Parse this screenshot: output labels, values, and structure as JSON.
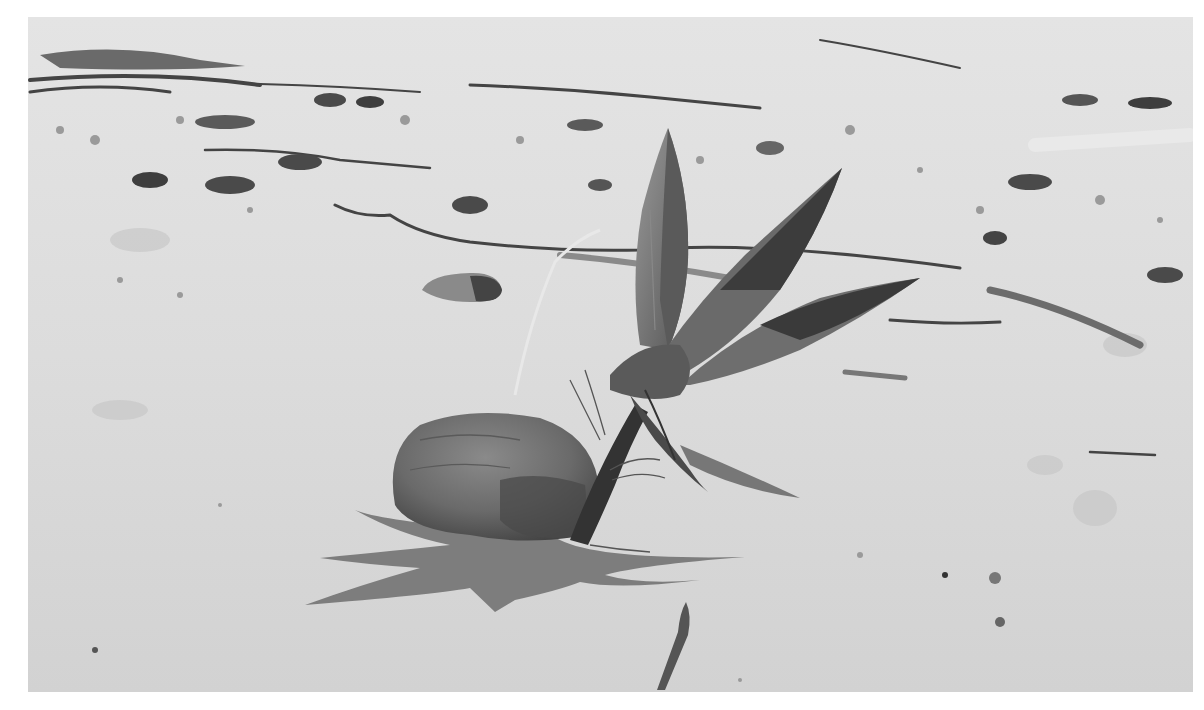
{
  "image": {
    "description": "Black-and-white photograph of a sprouting coconut lying on a sandy beach, casting a shadow, with driftwood and seaweed debris in the background",
    "mode": "grayscale",
    "frame_color": "#ffffff",
    "photo_bounds": {
      "x": 28,
      "y": 17,
      "width": 1165,
      "height": 675
    }
  },
  "palette": {
    "sand": "#d9d9d9",
    "sand_light": "#e6e6e6",
    "debris": "#4a4a4a",
    "coconut": "#6e6e6e",
    "coconut_dark": "#4f4f4f",
    "leaf": "#7a7a7a",
    "leaf_dark": "#3e3e3e",
    "shadow": "#7c7c7c",
    "stem": "#333333"
  },
  "subjects": [
    {
      "name": "coconut",
      "x": 390,
      "y": 410,
      "w": 205,
      "h": 130
    },
    {
      "name": "sprout",
      "x": 570,
      "y": 125,
      "w": 350,
      "h": 420
    },
    {
      "name": "shadow",
      "x": 305,
      "y": 510,
      "w": 440,
      "h": 110
    },
    {
      "name": "pebble",
      "x": 422,
      "y": 272,
      "w": 80,
      "h": 30
    },
    {
      "name": "debris-line",
      "x": 28,
      "y": 40,
      "w": 1165,
      "h": 250
    },
    {
      "name": "stick",
      "x": 655,
      "y": 600,
      "w": 40,
      "h": 90
    }
  ]
}
